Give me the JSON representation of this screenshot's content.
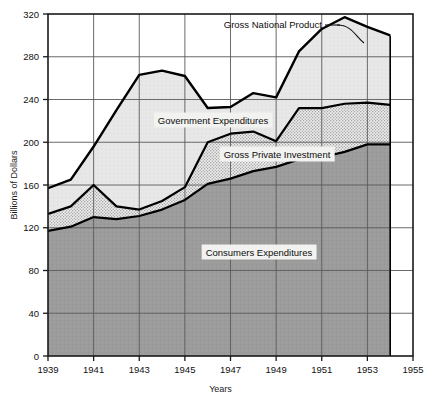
{
  "chart_data": {
    "type": "area",
    "stacked": true,
    "title": "",
    "xlabel": "Years",
    "ylabel": "Billions of Dollars",
    "xlim": [
      1939,
      1955
    ],
    "ylim": [
      0,
      320
    ],
    "xticks": [
      1939,
      1941,
      1943,
      1945,
      1947,
      1949,
      1951,
      1953,
      1955
    ],
    "yticks": [
      0,
      40,
      80,
      120,
      160,
      200,
      240,
      280,
      320
    ],
    "xtick_labels": [
      "1939",
      "1941",
      "1943",
      "1945",
      "1947",
      "1949",
      "1951",
      "1953",
      "1955"
    ],
    "ytick_labels": [
      "0",
      "40",
      "80",
      "120",
      "160",
      "200",
      "240",
      "280",
      "320"
    ],
    "grid": true,
    "legend_position": "inline-annotations",
    "x": [
      1939,
      1940,
      1941,
      1942,
      1943,
      1944,
      1945,
      1946,
      1947,
      1948,
      1949,
      1950,
      1951,
      1952,
      1953,
      1954
    ],
    "series": [
      {
        "name": "Consumers Expenditures",
        "fill": "#9a9a9a",
        "texture": "solid",
        "values": [
          117,
          121,
          130,
          128,
          131,
          137,
          146,
          161,
          166,
          173,
          177,
          184,
          186,
          191,
          198,
          198
        ]
      },
      {
        "name": "Gross Private Investment",
        "fill": "#d8d8d8",
        "texture": "stipple",
        "values": [
          16,
          19,
          30,
          12,
          6,
          8,
          12,
          39,
          42,
          37,
          24,
          48,
          46,
          45,
          39,
          37
        ]
      },
      {
        "name": "Government Expenditures",
        "fill": "#e6e6e6",
        "texture": "light",
        "values": [
          24,
          25,
          36,
          90,
          126,
          122,
          104,
          32,
          25,
          36,
          41,
          53,
          74,
          81,
          71,
          65
        ]
      }
    ],
    "cumulative": {
      "consumers": [
        117,
        121,
        130,
        128,
        131,
        137,
        146,
        161,
        166,
        173,
        177,
        184,
        186,
        191,
        198,
        198
      ],
      "consumers_plus_investment": [
        133,
        140,
        160,
        140,
        137,
        145,
        158,
        200,
        208,
        210,
        201,
        232,
        232,
        236,
        237,
        235
      ],
      "gross_national_product": [
        157,
        165,
        196,
        230,
        263,
        267,
        262,
        232,
        233,
        246,
        242,
        285,
        306,
        317,
        308,
        300
      ]
    },
    "annotations": [
      {
        "name": "gnp-callout",
        "text": "Gross National Product",
        "has_leader_line": true
      },
      {
        "name": "government-expenditures-label",
        "text": "Government Expenditures"
      },
      {
        "name": "gross-private-investment-label",
        "text": "Gross Private Investment"
      },
      {
        "name": "consumers-expenditures-label",
        "text": "Consumers Expenditures"
      }
    ],
    "colors": {
      "axis": "#1a1a1a",
      "grid": "#5a5a5a",
      "curve": "#000000",
      "consumers_fill": "#9a9a9a",
      "investment_fill": "#d8d8d8",
      "government_fill": "#e8e8e8",
      "background": "#ffffff"
    }
  },
  "axes": {
    "y_title": "Billions of Dollars",
    "x_title": "Years"
  }
}
